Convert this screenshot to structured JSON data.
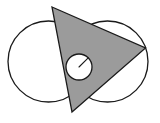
{
  "figure": {
    "canvas": {
      "width": 160,
      "height": 123,
      "background": "#ffffff"
    },
    "colors": {
      "stroke": "#1a1a1a",
      "triangle_fill": "#9b9b9b",
      "circle_fill": "#ffffff",
      "small_circle_fill": "#ffffff",
      "background": "#ffffff"
    },
    "stroke_width": 1.3,
    "shapes": {
      "left_circle": {
        "label": "left circle",
        "cx": 48.5,
        "cy": 61.5,
        "r": 40.5,
        "fill": "#ffffff"
      },
      "right_circle": {
        "label": "right circle",
        "cx": 107.5,
        "cy": 61.5,
        "r": 40.5,
        "fill": "#ffffff"
      },
      "triangle": {
        "label": "shaded triangle",
        "points": "52,7 145.5,48 72,112",
        "vertices": [
          {
            "name": "top",
            "x": 52,
            "y": 7
          },
          {
            "name": "right",
            "x": 145.5,
            "y": 48
          },
          {
            "name": "bottom",
            "x": 72,
            "y": 112
          }
        ],
        "fill": "#9b9b9b"
      },
      "small_circle": {
        "label": "small circle",
        "cx": 79,
        "cy": 67,
        "r": 13,
        "fill": "#ffffff"
      },
      "radius_line": {
        "label": "radius segment",
        "x1": 79,
        "y1": 67,
        "x2": 88.2,
        "y2": 57.8
      }
    }
  }
}
